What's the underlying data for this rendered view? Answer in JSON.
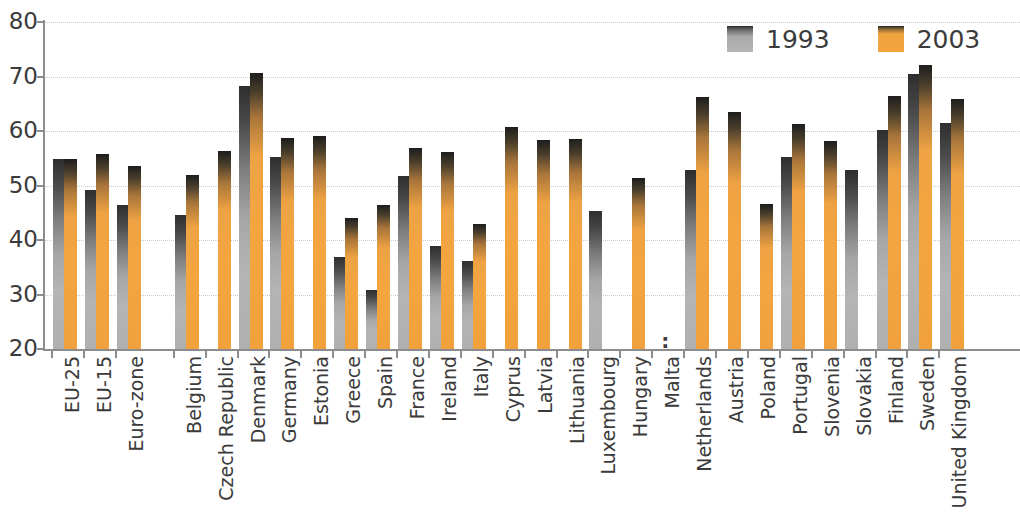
{
  "chart_data": {
    "type": "bar",
    "title": "",
    "subtitle": "",
    "xlabel": "",
    "ylabel": "",
    "ylim": [
      20,
      80
    ],
    "yticks": [
      20,
      30,
      40,
      50,
      60,
      70,
      80
    ],
    "ytick_labels": [
      "20",
      "30",
      "40",
      "50",
      "60",
      "70",
      "80"
    ],
    "grid": "horizontal-dotted",
    "legend_position": "top-right",
    "missing_value_symbol": ":",
    "colors": {
      "series_1993": "#b0b0b0",
      "series_2003": "#f2a53e",
      "axis": "#8d8d8d",
      "gridline": "#c9c9c9",
      "text": "#3b3b3b",
      "background": "#ffffff"
    },
    "categories": [
      "EU-25",
      "EU-15",
      "Euro-zone",
      "Belgium",
      "Czech Republic",
      "Denmark",
      "Germany",
      "Estonia",
      "Greece",
      "Spain",
      "France",
      "Ireland",
      "Italy",
      "Cyprus",
      "Latvia",
      "Lithuania",
      "Luxembourg",
      "Hungary",
      "Malta",
      "Netherlands",
      "Austria",
      "Poland",
      "Portugal",
      "Slovenia",
      "Slovakia",
      "Finland",
      "Sweden",
      "United Kingdom"
    ],
    "group_gaps_after": [
      "Euro-zone"
    ],
    "series": [
      {
        "name": "1993",
        "color": "#b0b0b0",
        "values": [
          54.9,
          49.2,
          46.5,
          44.6,
          null,
          68.3,
          55.2,
          null,
          36.8,
          30.9,
          51.8,
          38.9,
          36.1,
          null,
          null,
          null,
          45.3,
          null,
          null,
          52.8,
          null,
          null,
          55.3,
          null,
          52.8,
          60.1,
          70.5,
          61.4
        ]
      },
      {
        "name": "2003",
        "color": "#f2a53e",
        "values": [
          54.9,
          55.8,
          53.5,
          51.9,
          56.3,
          70.6,
          58.8,
          59.1,
          44.0,
          46.4,
          56.9,
          56.1,
          43.0,
          60.7,
          58.4,
          58.6,
          null,
          51.4,
          null,
          66.3,
          63.5,
          46.7,
          61.2,
          58.2,
          null,
          66.4,
          72.2,
          65.9
        ]
      }
    ],
    "notes": [
      "Malta has no data for either year; shown as ':' at the baseline.",
      "Luxembourg shows only the 1993 series.",
      "Czech Republic, Estonia, Cyprus, Latvia, Lithuania, Hungary, Austria, Poland and Slovenia show only the 2003 series.",
      "For EU-25 the 1993 and 2003 bars coincide.",
      "The United Kingdom bars are clipped by the right edge of the figure."
    ]
  },
  "legend": {
    "items": [
      {
        "label": "1993",
        "swatch": "gray-swatch-icon"
      },
      {
        "label": "2003",
        "swatch": "orange-swatch-icon"
      }
    ]
  }
}
